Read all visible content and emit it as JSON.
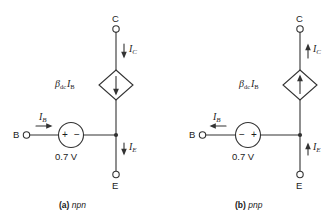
{
  "figure": {
    "circuits": [
      {
        "id": "npn",
        "caption_tag": "(a)",
        "caption_name": "npn",
        "terminals": {
          "collector": "C",
          "base": "B",
          "emitter": "E"
        },
        "currents": {
          "collector": "I",
          "collector_sub": "C",
          "collector_direction": "down",
          "base": "I",
          "base_sub": "B",
          "base_direction": "right",
          "emitter": "I",
          "emitter_sub": "E",
          "emitter_direction": "down"
        },
        "source": {
          "label": "0.7 V",
          "left_polarity": "+",
          "right_polarity": "−"
        },
        "dependent_source": {
          "beta": "β",
          "beta_sub": "dc",
          "current": "I",
          "current_sub": "B",
          "arrow_direction": "down"
        }
      },
      {
        "id": "pnp",
        "caption_tag": "(b)",
        "caption_name": "pnp",
        "terminals": {
          "collector": "C",
          "base": "B",
          "emitter": "E"
        },
        "currents": {
          "collector": "I",
          "collector_sub": "C",
          "collector_direction": "up",
          "base": "I",
          "base_sub": "B",
          "base_direction": "left",
          "emitter": "I",
          "emitter_sub": "E",
          "emitter_direction": "up"
        },
        "source": {
          "label": "0.7 V",
          "left_polarity": "−",
          "right_polarity": "+"
        },
        "dependent_source": {
          "beta": "β",
          "beta_sub": "dc",
          "current": "I",
          "current_sub": "B",
          "arrow_direction": "up"
        }
      }
    ],
    "colors": {
      "line": "#333333",
      "text": "#1c1c1c",
      "background": "#ffffff"
    }
  }
}
